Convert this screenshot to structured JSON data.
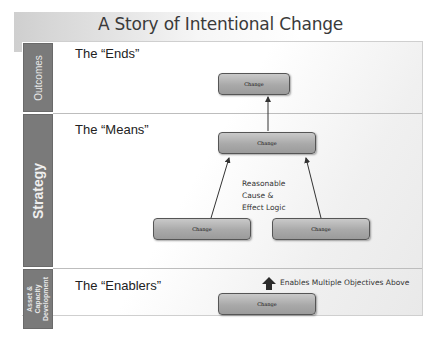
{
  "title": "A Story of Intentional Change",
  "bands": [
    {
      "label": "Outcomes"
    },
    {
      "label": "Strategy"
    },
    {
      "label_lines": [
        "Asset &",
        "Capacity",
        "Development"
      ]
    }
  ],
  "sections": {
    "ends": "The “Ends”",
    "means": "The “Means”",
    "enablers": "The “Enablers”"
  },
  "boxes": {
    "outcome": "Change",
    "strategy_main": "Change",
    "strategy_left": "Change",
    "strategy_right": "Change",
    "enabler": "Change"
  },
  "annotations": {
    "logic_lines": [
      "Reasonable",
      "Cause &",
      "Effect Logic"
    ],
    "enables": "Enables Multiple Objectives Above"
  },
  "colors": {
    "band": "#7a7a7a",
    "box_fill": "#a9a9a9",
    "box_border": "#555555",
    "arrow": "#333333"
  }
}
